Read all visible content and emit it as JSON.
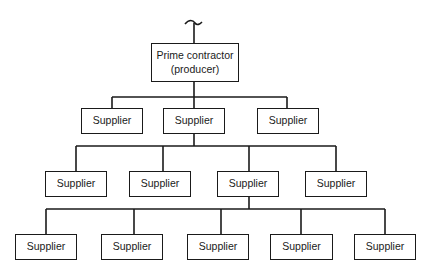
{
  "diagram": {
    "type": "hierarchy-tree",
    "line_color": "#1a1a1a",
    "root": {
      "line1": "Prime contractor",
      "line2": "(producer)"
    },
    "level1": [
      {
        "label": "Supplier"
      },
      {
        "label": "Supplier"
      },
      {
        "label": "Supplier"
      }
    ],
    "level2": [
      {
        "label": "Supplier"
      },
      {
        "label": "Supplier"
      },
      {
        "label": "Supplier"
      },
      {
        "label": "Supplier"
      }
    ],
    "level3": [
      {
        "label": "Supplier"
      },
      {
        "label": "Supplier"
      },
      {
        "label": "Supplier"
      },
      {
        "label": "Supplier"
      },
      {
        "label": "Supplier"
      }
    ],
    "edges": [
      [
        "root",
        "level1.0"
      ],
      [
        "root",
        "level1.1"
      ],
      [
        "root",
        "level1.2"
      ],
      [
        "level1.1",
        "level2.0"
      ],
      [
        "level1.1",
        "level2.1"
      ],
      [
        "level1.1",
        "level2.2"
      ],
      [
        "level1.1",
        "level2.3"
      ],
      [
        "level2.2",
        "level3.0"
      ],
      [
        "level2.2",
        "level3.1"
      ],
      [
        "level2.2",
        "level3.2"
      ],
      [
        "level2.2",
        "level3.3"
      ],
      [
        "level2.2",
        "level3.4"
      ]
    ]
  }
}
